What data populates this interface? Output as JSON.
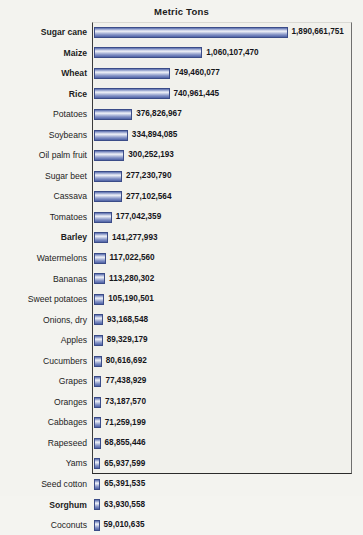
{
  "chart_data": {
    "type": "bar",
    "orientation": "horizontal",
    "title": "Metric Tons",
    "xlabel": "",
    "ylabel": "",
    "xlim": [
      0,
      1890661751
    ],
    "grid": false,
    "legend": null,
    "bar_color": "#7d8dc4",
    "bar_border_color": "#3b4c88",
    "plot_background": "#f1f1ec",
    "page_background": "#f3f3ef",
    "categories": [
      "Sugar cane",
      "Maize",
      "Wheat",
      "Rice",
      "Potatoes",
      "Soybeans",
      "Oil palm fruit",
      "Sugar beet",
      "Cassava",
      "Tomatoes",
      "Barley",
      "Watermelons",
      "Bananas",
      "Sweet potatoes",
      "Onions, dry",
      "Apples",
      "Cucumbers",
      "Grapes",
      "Oranges",
      "Cabbages",
      "Rapeseed",
      "Yams",
      "Seed cotton",
      "Sorghum",
      "Coconuts"
    ],
    "values": [
      1890661751,
      1060107470,
      749460077,
      740961445,
      376826967,
      334894085,
      300252193,
      277230790,
      277102564,
      177042359,
      141277993,
      117022560,
      113280302,
      105190501,
      93168548,
      89329179,
      80616692,
      77438929,
      73187570,
      71259199,
      68855446,
      65937599,
      65391535,
      63930558,
      59010635
    ],
    "value_labels": [
      "1,890,661,751",
      "1,060,107,470",
      "749,460,077",
      "740,961,445",
      "376,826,967",
      "334,894,085",
      "300,252,193",
      "277,230,790",
      "277,102,564",
      "177,042,359",
      "141,277,993",
      "117,022,560",
      "113,280,302",
      "105,190,501",
      "93,168,548",
      "89,329,179",
      "80,616,692",
      "77,438,929",
      "73,187,570",
      "71,259,199",
      "68,855,446",
      "65,937,599",
      "65,391,535",
      "63,930,558",
      "59,010,635"
    ],
    "bold_categories": [
      "Sugar cane",
      "Maize",
      "Wheat",
      "Rice",
      "Barley",
      "Sorghum"
    ]
  }
}
